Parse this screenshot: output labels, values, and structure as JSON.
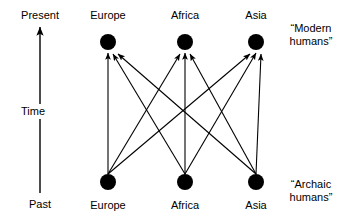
{
  "figure": {
    "kind": "multiregional-evolution-diagram",
    "background_color": "#ffffff",
    "ink_color": "#000000"
  },
  "time_axis": {
    "top_label": "Present",
    "middle_label": "Time",
    "bottom_label": "Past",
    "direction": "upward",
    "arrow_head": "arrow-up-icon"
  },
  "top_row": {
    "group_label_line1": "“Modern",
    "group_label_line2": "humans”",
    "nodes": [
      {
        "label": "Europe",
        "cx": 108,
        "cy": 42,
        "r": 8
      },
      {
        "label": "Africa",
        "cx": 185,
        "cy": 42,
        "r": 8
      },
      {
        "label": "Asia",
        "cx": 256,
        "cy": 42,
        "r": 8
      }
    ]
  },
  "bottom_row": {
    "group_label_line1": "“Archaic",
    "group_label_line2": "humans”",
    "nodes": [
      {
        "label": "Europe",
        "cx": 108,
        "cy": 182,
        "r": 8
      },
      {
        "label": "Africa",
        "cx": 185,
        "cy": 182,
        "r": 8
      },
      {
        "label": "Asia",
        "cx": 256,
        "cy": 182,
        "r": 8
      }
    ]
  },
  "edges": [
    {
      "from": "Europe",
      "to": "Europe",
      "arrow": true
    },
    {
      "from": "Europe",
      "to": "Africa",
      "arrow": true
    },
    {
      "from": "Europe",
      "to": "Asia",
      "arrow": true
    },
    {
      "from": "Africa",
      "to": "Europe",
      "arrow": true
    },
    {
      "from": "Africa",
      "to": "Africa",
      "arrow": true
    },
    {
      "from": "Africa",
      "to": "Asia",
      "arrow": true
    },
    {
      "from": "Asia",
      "to": "Europe",
      "arrow": true
    },
    {
      "from": "Asia",
      "to": "Africa",
      "arrow": true
    },
    {
      "from": "Asia",
      "to": "Asia",
      "arrow": true
    }
  ]
}
